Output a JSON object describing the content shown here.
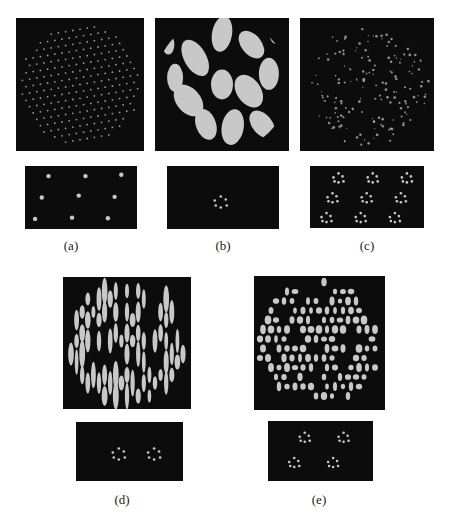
{
  "figure": {
    "panels": [
      {
        "id": "a",
        "label": "(a)",
        "top_pattern": "hexagonal-dot-lattice",
        "bottom_pattern": "3x3-spot-array"
      },
      {
        "id": "b",
        "label": "(b)",
        "top_pattern": "binary-phase-blobs",
        "bottom_pattern": "single-spot-cluster"
      },
      {
        "id": "c",
        "label": "(c)",
        "top_pattern": "sparse-dot-pattern",
        "bottom_pattern": "3x3-cluster-array"
      },
      {
        "id": "d",
        "label": "(d)",
        "top_pattern": "vertical-ellipse-pattern",
        "bottom_pattern": "two-spot-clusters"
      },
      {
        "id": "e",
        "label": "(e)",
        "top_pattern": "elliptical-dot-pattern",
        "bottom_pattern": "2x2-cluster-array"
      }
    ],
    "colors": {
      "background": "#0c0c0c",
      "foreground": "#c8c8c8"
    }
  }
}
